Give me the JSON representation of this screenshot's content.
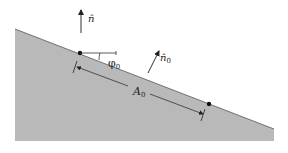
{
  "diagram": {
    "type": "inclined-surface",
    "colors": {
      "surface_fill": "#b9b9b9",
      "surface_edge": "#555555",
      "ink": "#222222",
      "background": "#ffffff"
    },
    "labels": {
      "vertical_normal": "n̂",
      "surface_normal": "n̂",
      "surface_normal_subscript": "0",
      "angle": "φ",
      "angle_subscript": "0",
      "area": "A",
      "area_subscript": "0"
    }
  }
}
